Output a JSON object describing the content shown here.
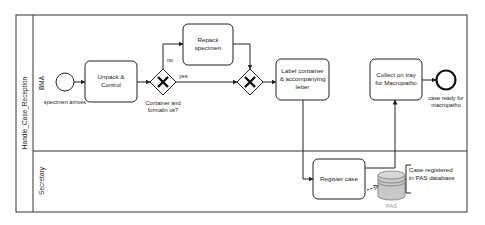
{
  "pool": {
    "title": "Handle_Case_Reception",
    "lanes": [
      {
        "id": "bma",
        "label": "BMA"
      },
      {
        "id": "secretary",
        "label": "Secretary"
      }
    ]
  },
  "events": {
    "start": {
      "label": "specimen arrives"
    },
    "end": {
      "label_line1": "case ready for",
      "label_line2": "macropatho"
    }
  },
  "tasks": {
    "unpack": {
      "line1": "Unpack &",
      "line2": "Control"
    },
    "repack": {
      "line1": "Repack",
      "line2": "specimen"
    },
    "label": {
      "line1": "Label container",
      "line2": "& accompanying",
      "line3": "letter"
    },
    "collect": {
      "line1": "Collect on tray",
      "line2": "for Macropatho"
    },
    "register": {
      "line1": "Register case"
    }
  },
  "gateways": {
    "check": {
      "type": "exclusive",
      "label_line1": "Container and",
      "label_line2": "formalin ok?"
    },
    "merge": {
      "type": "exclusive"
    }
  },
  "flows": {
    "no_label": "no",
    "yes_label": "yes"
  },
  "data_store": {
    "label": "PAS",
    "annotation_line1": "Case registered",
    "annotation_line2": "in PAS database"
  },
  "colors": {
    "stroke": "#222222",
    "db_fill": "#c8c8c8",
    "db_top": "#d8d8d8",
    "muted_text": "#999999"
  }
}
